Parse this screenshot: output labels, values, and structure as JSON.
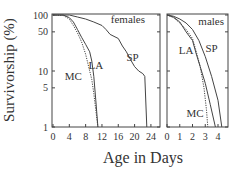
{
  "chart_data": [
    {
      "type": "line",
      "panel": "left",
      "title": "",
      "annotation": "females",
      "xlabel": "Age in Days",
      "ylabel": "Survivorship (%)",
      "yscale": "log",
      "ylim": [
        1,
        100
      ],
      "xlim": [
        0,
        25.5
      ],
      "xticks": [
        "0",
        "4",
        "8",
        "12",
        "16",
        "20",
        "24"
      ],
      "yticks": [
        "100",
        "50",
        "10",
        "5",
        "1"
      ],
      "grid": false,
      "series": [
        {
          "name": "SP",
          "style": "solid",
          "x": [
            0,
            4,
            6,
            8,
            10,
            12,
            13,
            14,
            16,
            17,
            18,
            19,
            20,
            21,
            22,
            22.5,
            23
          ],
          "y": [
            100,
            100,
            92,
            85,
            75,
            65,
            55,
            45,
            38,
            28,
            22,
            16,
            12,
            10,
            9,
            8,
            1
          ]
        },
        {
          "name": "LA",
          "style": "solid",
          "x": [
            0,
            2.5,
            4,
            5,
            6,
            7,
            8,
            9,
            9.5,
            10,
            10.5,
            11
          ],
          "y": [
            100,
            100,
            90,
            75,
            55,
            40,
            30,
            22,
            15,
            8,
            3,
            1
          ]
        },
        {
          "name": "MC",
          "style": "dotted",
          "x": [
            0,
            2.5,
            4,
            5,
            6,
            7,
            8,
            9,
            9.5,
            10,
            10.5,
            11
          ],
          "y": [
            100,
            98,
            85,
            65,
            48,
            33,
            20,
            10,
            7,
            4,
            2,
            1
          ]
        }
      ],
      "labels": [
        {
          "text": "SP",
          "x": 19.5,
          "y": 15
        },
        {
          "text": "LA",
          "x": 10.5,
          "y": 11
        },
        {
          "text": "MC",
          "x": 5,
          "y": 7
        }
      ]
    },
    {
      "type": "line",
      "panel": "right",
      "title": "",
      "annotation": "males",
      "xlabel": "Age in Days",
      "ylabel": "Survivorship (%)",
      "yscale": "log",
      "ylim": [
        1,
        100
      ],
      "xlim": [
        0,
        4.7
      ],
      "xticks": [
        "0",
        "1",
        "2",
        "3",
        "4"
      ],
      "yticks": [
        "100",
        "50",
        "10",
        "5",
        "1"
      ],
      "grid": false,
      "series": [
        {
          "name": "SP",
          "style": "solid",
          "x": [
            0,
            0.5,
            1,
            1.5,
            2,
            2.5,
            3,
            3.5,
            4,
            4.3
          ],
          "y": [
            100,
            95,
            85,
            72,
            55,
            35,
            18,
            8,
            3,
            1
          ]
        },
        {
          "name": "LA",
          "style": "solid",
          "x": [
            0,
            0.5,
            1,
            1.5,
            2,
            2.3,
            2.6,
            3,
            3.4,
            3.8
          ],
          "y": [
            100,
            92,
            75,
            50,
            35,
            20,
            12,
            6,
            2.5,
            1
          ]
        },
        {
          "name": "MC",
          "style": "dotted",
          "x": [
            0,
            0.5,
            1,
            1.5,
            2,
            2.3,
            2.6,
            2.9,
            3.1,
            3.2
          ],
          "y": [
            100,
            90,
            72,
            55,
            38,
            22,
            12,
            5,
            2,
            1
          ]
        }
      ],
      "labels": [
        {
          "text": "SP",
          "x": 3.5,
          "y": 22
        },
        {
          "text": "LA",
          "x": 1.5,
          "y": 20
        },
        {
          "text": "MC",
          "x": 2.2,
          "y": 1.5
        }
      ]
    }
  ],
  "figure": {
    "ylabel": "Survivorship (%)",
    "xlabel": "Age in Days",
    "colors": {
      "line": "#444444",
      "frame": "#444444",
      "text": "#333333"
    }
  }
}
